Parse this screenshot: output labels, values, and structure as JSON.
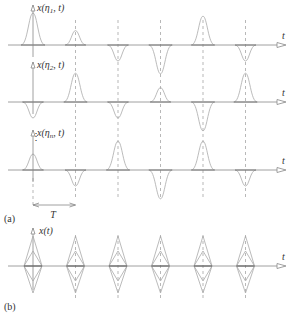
{
  "figure": {
    "panel_a_label": "(a)",
    "panel_b_label": "(b)",
    "period_label": "T",
    "time_axis_label": "t",
    "rows": [
      {
        "ylabel": "x(η1, t)",
        "amplitudes": [
          1.0,
          0.45,
          -0.5,
          -0.9,
          0.9,
          -0.5
        ]
      },
      {
        "ylabel": "x(η2, t)",
        "amplitudes": [
          -0.5,
          0.9,
          -0.5,
          0.45,
          -0.9,
          0.9
        ]
      },
      {
        "ylabel": "x(ηn, t)",
        "amplitudes": [
          0.5,
          -0.5,
          0.9,
          -0.9,
          0.9,
          -0.5
        ]
      }
    ],
    "ensemble_ylabel": "x(t)",
    "ellipsis": "⋮"
  },
  "layout": {
    "origin_x": 33,
    "period_px": 42.5,
    "row_baselines": [
      45,
      102,
      170
    ],
    "ensemble_baseline": 266
  }
}
